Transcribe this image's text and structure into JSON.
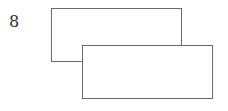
{
  "figure": {
    "label": "8",
    "shapes": [
      {
        "id": "rect-back",
        "type": "rectangle",
        "description": "upper-left rectangle (behind)"
      },
      {
        "id": "rect-front",
        "type": "rectangle",
        "description": "lower-right rectangle (in front, overlapping)"
      }
    ],
    "colors": {
      "stroke": "#6a6a6a",
      "fill": "#ffffff",
      "text": "#333333"
    }
  }
}
